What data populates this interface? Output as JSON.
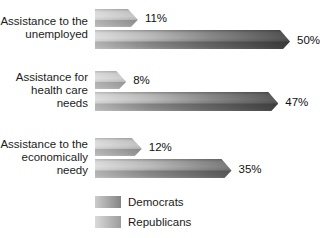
{
  "chart_data": {
    "type": "bar",
    "orientation": "horizontal",
    "title": "",
    "categories": [
      "Assistance to the unemployed",
      "Assistance for health care needs",
      "Assistance to the economically needy"
    ],
    "category_lines": [
      [
        "Assistance to the",
        "unemployed"
      ],
      [
        "Assistance for",
        "health care needs"
      ],
      [
        "Assistance to the",
        "economically needy"
      ]
    ],
    "series": [
      {
        "name": "Democrats",
        "values": [
          11,
          8,
          12
        ],
        "labels": [
          "11%",
          "8%",
          "12%"
        ]
      },
      {
        "name": "Republicans",
        "values": [
          50,
          47,
          35
        ],
        "labels": [
          "50%",
          "47%",
          "35%"
        ]
      }
    ],
    "xlim": [
      0,
      50
    ],
    "px_per_percent": 3.9,
    "grid": false,
    "axes_shown": false,
    "legend_position": "bottom-left",
    "bar_style": "3d-beveled-gray-gradient",
    "colors": {
      "bar_light": "#d2d2d2",
      "bar_dark": "#2b2b2b",
      "text": "#1a1a1a",
      "background": "#ffffff"
    }
  }
}
